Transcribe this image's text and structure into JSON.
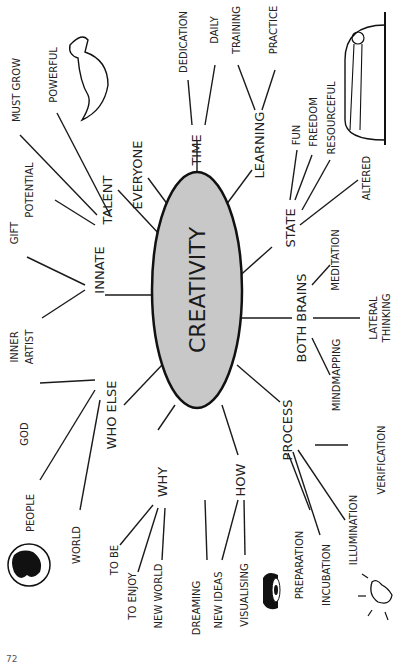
{
  "center": {
    "label": "CREATIVITY",
    "fill": "#c8c8c8"
  },
  "branches": {
    "innate": {
      "label": "INNATE",
      "children": [
        "GIFT",
        "INNER",
        "ARTIST"
      ]
    },
    "talent": {
      "label": "TALENT",
      "children": [
        "POTENTIAL",
        "MUST GROW",
        "POWERFUL"
      ]
    },
    "everyone": {
      "label": "EVERYONE"
    },
    "time": {
      "label": "TIME",
      "children": [
        "DEDICATION",
        "DAILY"
      ]
    },
    "learning": {
      "label": "LEARNING",
      "children": [
        "TRAINING",
        "PRACTICE"
      ]
    },
    "state": {
      "label": "STATE",
      "children": [
        "FUN",
        "FREEDOM",
        "RESOURCEFUL",
        "ALTERED"
      ]
    },
    "both_brains": {
      "label": "BOTH BRAINS",
      "children": [
        "MEDITATION",
        "LATERAL",
        "THINKING",
        "MINDMAPPING"
      ]
    },
    "process": {
      "label": "PROCESS",
      "children": [
        "PREPARATION",
        "INCUBATION",
        "ILLUMINATION",
        "VERIFICATION"
      ]
    },
    "how": {
      "label": "HOW",
      "children": [
        "DREAMING",
        "NEW IDEAS",
        "VISUALISING"
      ]
    },
    "why": {
      "label": "WHY",
      "children": [
        "TO BE",
        "TO ENJOY",
        "NEW WORLD"
      ]
    },
    "who_else": {
      "label": "WHO ELSE",
      "children": [
        "GOD",
        "PEOPLE",
        "WORLD"
      ]
    }
  },
  "page_number": "72"
}
